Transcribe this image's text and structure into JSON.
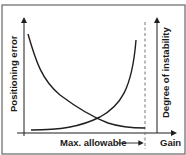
{
  "diagram": {
    "type": "conceptual-curves",
    "left_axis_label": "Positioning error",
    "right_axis_label": "Degree of instability",
    "x_axis_label": "Gain",
    "marker_label": "Max. allowable",
    "curves": [
      {
        "name": "positioning-error",
        "trend": "decreasing with gain"
      },
      {
        "name": "degree-of-instability",
        "trend": "increasing with gain"
      }
    ],
    "colors": {
      "line": "#1f1f1f",
      "dashed": "#777777",
      "frame": "#555555"
    }
  }
}
